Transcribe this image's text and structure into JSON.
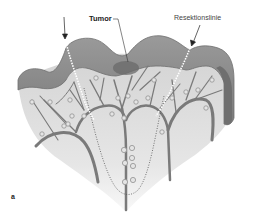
{
  "figure": {
    "panel_label": "a",
    "labels": {
      "tumor": "Tumor",
      "resection_line": "Resektionslinie"
    },
    "colors": {
      "bowel_wall": "#8a8a8a",
      "bowel_wall_dark": "#6e6e6e",
      "mesentery": "#d8d8d8",
      "mesentery_light": "#ececec",
      "vessels": "#7a7a7a",
      "lymph_nodes": "#9a9a9a",
      "resection_line": "#ffffff",
      "inner_dotted_line": "#555555",
      "tumor": "#6a6a6a"
    }
  }
}
